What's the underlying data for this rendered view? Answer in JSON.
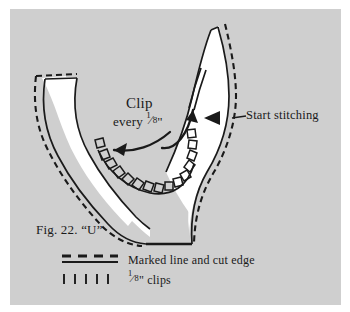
{
  "figure": {
    "caption": "Fig. 22. “U”",
    "panel_color": "#cfcfcf",
    "page_color": "#ffffff",
    "ink_color": "#1a1a1a",
    "fabric_color": "#ffffff"
  },
  "annotations": {
    "clip_label": "Clip",
    "clip_interval_prefix": "every ",
    "clip_interval_fraction_numerator": "1",
    "clip_interval_fraction_slash": "⁄",
    "clip_interval_fraction_denominator": "8",
    "clip_interval_suffix": "\"",
    "start_stitching": "Start stitching"
  },
  "legend": {
    "rows": [
      {
        "swatch": "solid-and-dashed-line-swatch",
        "label": "Marked line and cut edge"
      },
      {
        "swatch": "tick-marks-swatch",
        "label_prefix": "",
        "fraction_numerator": "1",
        "fraction_slash": "⁄",
        "fraction_denominator": "8",
        "label_suffix": "\" clips"
      }
    ]
  },
  "icons": {
    "arrowhead": "triangle-left-icon",
    "clip_arrow_left": "curved-arrow-left-icon",
    "clip_arrow_up": "curved-arrow-up-icon"
  }
}
